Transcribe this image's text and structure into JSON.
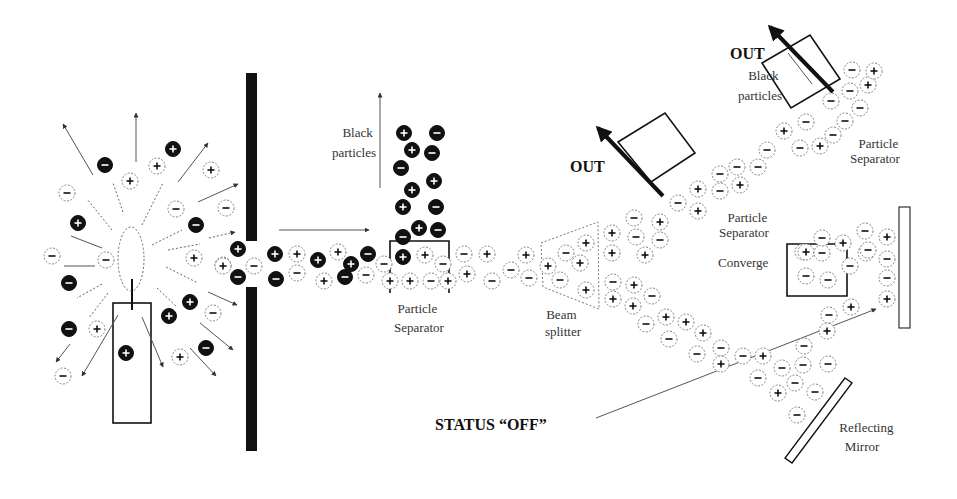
{
  "diagram": {
    "labels": {
      "black_particles_1": [
        "Black",
        "particles"
      ],
      "particle_separator_1": [
        "Particle",
        "Separator"
      ],
      "beam_splitter": [
        "Beam",
        "splitter"
      ],
      "out_1": "OUT",
      "out_2": "OUT",
      "black_particles_2": [
        "Black",
        "particles"
      ],
      "particle_separator_2": [
        "Particle",
        "Separator"
      ],
      "particle_separator_3": [
        "Particle",
        "Separator"
      ],
      "converge": "Converge",
      "status": "STATUS “OFF”",
      "reflecting_mirror": [
        "Reflecting",
        "Mirror"
      ]
    },
    "components": [
      "candle",
      "flame",
      "barrier-wall",
      "particle-separator-1",
      "beam-splitter",
      "out-box-1",
      "out-box-2",
      "converge-box",
      "target-plate",
      "reflecting-mirror"
    ],
    "particles": [
      {
        "x": 105,
        "y": 165,
        "s": "-",
        "b": true
      },
      {
        "x": 130,
        "y": 181,
        "s": "+",
        "b": false
      },
      {
        "x": 157,
        "y": 166,
        "s": "+",
        "b": false
      },
      {
        "x": 173,
        "y": 149,
        "s": "+",
        "b": true
      },
      {
        "x": 211,
        "y": 170,
        "s": "+",
        "b": false
      },
      {
        "x": 67,
        "y": 193,
        "s": "-",
        "b": false
      },
      {
        "x": 176,
        "y": 209,
        "s": "-",
        "b": false
      },
      {
        "x": 226,
        "y": 208,
        "s": "-",
        "b": false
      },
      {
        "x": 78,
        "y": 223,
        "s": "+",
        "b": true
      },
      {
        "x": 196,
        "y": 225,
        "s": "-",
        "b": true
      },
      {
        "x": 52,
        "y": 256,
        "s": "-",
        "b": false
      },
      {
        "x": 106,
        "y": 260,
        "s": "-",
        "b": false
      },
      {
        "x": 194,
        "y": 258,
        "s": "+",
        "b": false
      },
      {
        "x": 223,
        "y": 265,
        "s": "+",
        "b": false
      },
      {
        "x": 69,
        "y": 283,
        "s": "-",
        "b": true
      },
      {
        "x": 190,
        "y": 302,
        "s": "+",
        "b": true
      },
      {
        "x": 169,
        "y": 316,
        "s": "+",
        "b": true
      },
      {
        "x": 213,
        "y": 313,
        "s": "-",
        "b": false
      },
      {
        "x": 69,
        "y": 329,
        "s": "-",
        "b": true
      },
      {
        "x": 97,
        "y": 329,
        "s": "+",
        "b": false
      },
      {
        "x": 126,
        "y": 353,
        "s": "+",
        "b": true
      },
      {
        "x": 206,
        "y": 348,
        "s": "-",
        "b": true
      },
      {
        "x": 180,
        "y": 357,
        "s": "+",
        "b": false
      },
      {
        "x": 63,
        "y": 376,
        "s": "-",
        "b": false
      },
      {
        "x": 238,
        "y": 249,
        "s": "+",
        "b": true
      },
      {
        "x": 223,
        "y": 266,
        "s": "+",
        "b": false
      },
      {
        "x": 254,
        "y": 266,
        "s": "-",
        "b": false
      },
      {
        "x": 238,
        "y": 277,
        "s": "-",
        "b": true
      },
      {
        "x": 275,
        "y": 254,
        "s": "+",
        "b": true
      },
      {
        "x": 297,
        "y": 254,
        "s": "+",
        "b": false
      },
      {
        "x": 276,
        "y": 279,
        "s": "-",
        "b": true
      },
      {
        "x": 297,
        "y": 273,
        "s": "-",
        "b": false
      },
      {
        "x": 318,
        "y": 260,
        "s": "+",
        "b": true
      },
      {
        "x": 338,
        "y": 252,
        "s": "+",
        "b": false
      },
      {
        "x": 324,
        "y": 281,
        "s": "+",
        "b": false
      },
      {
        "x": 345,
        "y": 277,
        "s": "-",
        "b": true
      },
      {
        "x": 351,
        "y": 264,
        "s": "+",
        "b": true
      },
      {
        "x": 366,
        "y": 275,
        "s": "-",
        "b": false
      },
      {
        "x": 368,
        "y": 254,
        "s": "-",
        "b": true
      },
      {
        "x": 384,
        "y": 264,
        "s": "-",
        "b": false
      },
      {
        "x": 404,
        "y": 133,
        "s": "+",
        "b": true
      },
      {
        "x": 437,
        "y": 133,
        "s": "-",
        "b": true
      },
      {
        "x": 412,
        "y": 150,
        "s": "+",
        "b": true
      },
      {
        "x": 432,
        "y": 153,
        "s": "-",
        "b": true
      },
      {
        "x": 401,
        "y": 168,
        "s": "-",
        "b": true
      },
      {
        "x": 412,
        "y": 190,
        "s": "+",
        "b": true
      },
      {
        "x": 434,
        "y": 181,
        "s": "+",
        "b": true
      },
      {
        "x": 403,
        "y": 207,
        "s": "+",
        "b": true
      },
      {
        "x": 436,
        "y": 207,
        "s": "-",
        "b": true
      },
      {
        "x": 419,
        "y": 228,
        "s": "+",
        "b": true
      },
      {
        "x": 438,
        "y": 230,
        "s": "-",
        "b": true
      },
      {
        "x": 403,
        "y": 237,
        "s": "-",
        "b": true
      },
      {
        "x": 403,
        "y": 257,
        "s": "+",
        "b": true
      },
      {
        "x": 425,
        "y": 255,
        "s": "+",
        "b": false
      },
      {
        "x": 443,
        "y": 264,
        "s": "-",
        "b": false
      },
      {
        "x": 390,
        "y": 281,
        "s": "+",
        "b": false
      },
      {
        "x": 410,
        "y": 281,
        "s": "+",
        "b": false
      },
      {
        "x": 431,
        "y": 281,
        "s": "-",
        "b": false
      },
      {
        "x": 448,
        "y": 281,
        "s": "+",
        "b": false
      },
      {
        "x": 464,
        "y": 254,
        "s": "-",
        "b": false
      },
      {
        "x": 487,
        "y": 254,
        "s": "+",
        "b": false
      },
      {
        "x": 467,
        "y": 274,
        "s": "+",
        "b": false
      },
      {
        "x": 492,
        "y": 281,
        "s": "-",
        "b": false
      },
      {
        "x": 511,
        "y": 270,
        "s": "-",
        "b": false
      },
      {
        "x": 526,
        "y": 255,
        "s": "+",
        "b": false
      },
      {
        "x": 529,
        "y": 278,
        "s": "-",
        "b": false
      },
      {
        "x": 548,
        "y": 266,
        "s": "+",
        "b": false
      },
      {
        "x": 566,
        "y": 253,
        "s": "-",
        "b": false
      },
      {
        "x": 586,
        "y": 243,
        "s": "+",
        "b": false
      },
      {
        "x": 580,
        "y": 263,
        "s": "+",
        "b": false
      },
      {
        "x": 560,
        "y": 280,
        "s": "-",
        "b": false
      },
      {
        "x": 586,
        "y": 290,
        "s": "+",
        "b": false
      },
      {
        "x": 612,
        "y": 233,
        "s": "+",
        "b": false
      },
      {
        "x": 612,
        "y": 253,
        "s": "+",
        "b": false
      },
      {
        "x": 634,
        "y": 218,
        "s": "-",
        "b": false
      },
      {
        "x": 660,
        "y": 222,
        "s": "+",
        "b": false
      },
      {
        "x": 636,
        "y": 237,
        "s": "-",
        "b": false
      },
      {
        "x": 660,
        "y": 240,
        "s": "-",
        "b": false
      },
      {
        "x": 645,
        "y": 255,
        "s": "+",
        "b": false
      },
      {
        "x": 613,
        "y": 282,
        "s": "-",
        "b": false
      },
      {
        "x": 634,
        "y": 285,
        "s": "+",
        "b": false
      },
      {
        "x": 613,
        "y": 299,
        "s": "+",
        "b": false
      },
      {
        "x": 633,
        "y": 306,
        "s": "+",
        "b": false
      },
      {
        "x": 652,
        "y": 296,
        "s": "-",
        "b": false
      },
      {
        "x": 646,
        "y": 324,
        "s": "-",
        "b": false
      },
      {
        "x": 666,
        "y": 317,
        "s": "+",
        "b": false
      },
      {
        "x": 686,
        "y": 322,
        "s": "+",
        "b": false
      },
      {
        "x": 669,
        "y": 339,
        "s": "-",
        "b": false
      },
      {
        "x": 703,
        "y": 333,
        "s": "+",
        "b": false
      },
      {
        "x": 697,
        "y": 354,
        "s": "-",
        "b": false
      },
      {
        "x": 721,
        "y": 348,
        "s": "-",
        "b": false
      },
      {
        "x": 721,
        "y": 364,
        "s": "+",
        "b": false
      },
      {
        "x": 743,
        "y": 356,
        "s": "-",
        "b": false
      },
      {
        "x": 763,
        "y": 356,
        "s": "+",
        "b": false
      },
      {
        "x": 782,
        "y": 368,
        "s": "-",
        "b": false
      },
      {
        "x": 803,
        "y": 365,
        "s": "-",
        "b": false
      },
      {
        "x": 758,
        "y": 378,
        "s": "-",
        "b": false
      },
      {
        "x": 795,
        "y": 383,
        "s": "-",
        "b": false
      },
      {
        "x": 828,
        "y": 364,
        "s": "-",
        "b": false
      },
      {
        "x": 778,
        "y": 393,
        "s": "+",
        "b": false
      },
      {
        "x": 815,
        "y": 392,
        "s": "-",
        "b": false
      },
      {
        "x": 797,
        "y": 415,
        "s": "-",
        "b": false
      },
      {
        "x": 804,
        "y": 346,
        "s": "-",
        "b": false
      },
      {
        "x": 827,
        "y": 331,
        "s": "+",
        "b": false
      },
      {
        "x": 678,
        "y": 203,
        "s": "-",
        "b": false
      },
      {
        "x": 698,
        "y": 189,
        "s": "+",
        "b": false
      },
      {
        "x": 698,
        "y": 211,
        "s": "+",
        "b": false
      },
      {
        "x": 720,
        "y": 191,
        "s": "-",
        "b": false
      },
      {
        "x": 740,
        "y": 185,
        "s": "+",
        "b": false
      },
      {
        "x": 720,
        "y": 174,
        "s": "-",
        "b": false
      },
      {
        "x": 737,
        "y": 167,
        "s": "-",
        "b": false
      },
      {
        "x": 758,
        "y": 167,
        "s": "-",
        "b": false
      },
      {
        "x": 767,
        "y": 150,
        "s": "-",
        "b": false
      },
      {
        "x": 784,
        "y": 131,
        "s": "+",
        "b": false
      },
      {
        "x": 806,
        "y": 122,
        "s": "-",
        "b": false
      },
      {
        "x": 800,
        "y": 148,
        "s": "-",
        "b": false
      },
      {
        "x": 820,
        "y": 146,
        "s": "+",
        "b": false
      },
      {
        "x": 833,
        "y": 135,
        "s": "-",
        "b": false
      },
      {
        "x": 831,
        "y": 101,
        "s": "-",
        "b": false
      },
      {
        "x": 850,
        "y": 91,
        "s": "-",
        "b": false
      },
      {
        "x": 860,
        "y": 108,
        "s": "-",
        "b": false
      },
      {
        "x": 868,
        "y": 85,
        "s": "+",
        "b": false
      },
      {
        "x": 845,
        "y": 121,
        "s": "-",
        "b": false
      },
      {
        "x": 852,
        "y": 70,
        "s": "-",
        "b": false
      },
      {
        "x": 874,
        "y": 71,
        "s": "+",
        "b": false
      },
      {
        "x": 803,
        "y": 252,
        "s": "+",
        "b": false
      },
      {
        "x": 806,
        "y": 276,
        "s": "-",
        "b": false
      },
      {
        "x": 806,
        "y": 252,
        "s": "+",
        "b": false
      },
      {
        "x": 822,
        "y": 253,
        "s": "-",
        "b": false
      },
      {
        "x": 822,
        "y": 238,
        "s": "-",
        "b": false
      },
      {
        "x": 828,
        "y": 280,
        "s": "-",
        "b": false
      },
      {
        "x": 843,
        "y": 243,
        "s": "+",
        "b": false
      },
      {
        "x": 850,
        "y": 266,
        "s": "-",
        "b": false
      },
      {
        "x": 866,
        "y": 253,
        "s": "-",
        "b": false
      },
      {
        "x": 865,
        "y": 231,
        "s": "-",
        "b": false
      },
      {
        "x": 887,
        "y": 237,
        "s": "+",
        "b": false
      },
      {
        "x": 887,
        "y": 259,
        "s": "-",
        "b": false
      },
      {
        "x": 887,
        "y": 278,
        "s": "-",
        "b": false
      },
      {
        "x": 887,
        "y": 299,
        "s": "+",
        "b": false
      },
      {
        "x": 851,
        "y": 307,
        "s": "+",
        "b": false
      },
      {
        "x": 829,
        "y": 315,
        "s": "-",
        "b": false
      },
      {
        "x": 868,
        "y": 250,
        "s": "-",
        "b": false
      }
    ]
  }
}
